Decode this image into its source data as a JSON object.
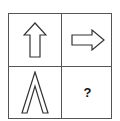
{
  "puzzle": {
    "cells": [
      {
        "position": "top-left",
        "content": "arrow-up-outline"
      },
      {
        "position": "top-right",
        "content": "arrow-right-outline"
      },
      {
        "position": "bottom-left",
        "content": "chevron-up-outline"
      },
      {
        "position": "bottom-right",
        "content": "?"
      }
    ],
    "missing_label": "?",
    "line_color": "#555555"
  }
}
